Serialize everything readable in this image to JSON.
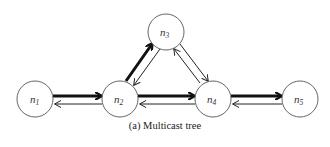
{
  "figure": {
    "caption": "(a) Multicast tree",
    "nodes": [
      {
        "id": "n1",
        "label": "n",
        "sub": "1",
        "cx": 35,
        "cy": 99,
        "r": 18
      },
      {
        "id": "n2",
        "label": "n",
        "sub": "2",
        "cx": 120,
        "cy": 99,
        "r": 18
      },
      {
        "id": "n3",
        "label": "n",
        "sub": "3",
        "cx": 166,
        "cy": 32,
        "r": 18
      },
      {
        "id": "n4",
        "label": "n",
        "sub": "4",
        "cx": 213,
        "cy": 99,
        "r": 18
      },
      {
        "id": "n5",
        "label": "n",
        "sub": "5",
        "cx": 300,
        "cy": 99,
        "r": 18
      }
    ],
    "edges": [
      {
        "from": "n1",
        "to": "n2",
        "style": "thick"
      },
      {
        "from": "n2",
        "to": "n1",
        "style": "thin"
      },
      {
        "from": "n2",
        "to": "n3",
        "style": "thick"
      },
      {
        "from": "n3",
        "to": "n2",
        "style": "thin"
      },
      {
        "from": "n2",
        "to": "n4",
        "style": "thick"
      },
      {
        "from": "n4",
        "to": "n2",
        "style": "thin"
      },
      {
        "from": "n3",
        "to": "n4",
        "style": "thin"
      },
      {
        "from": "n4",
        "to": "n3",
        "style": "thin"
      },
      {
        "from": "n4",
        "to": "n5",
        "style": "thick"
      },
      {
        "from": "n5",
        "to": "n4",
        "style": "thin"
      }
    ],
    "colors": {
      "stroke": "#222222",
      "node_stroke": "#555555"
    }
  }
}
